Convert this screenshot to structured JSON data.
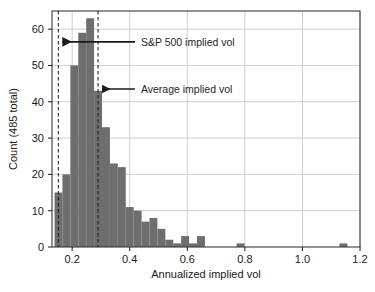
{
  "chart_data": {
    "type": "bar",
    "title": "",
    "subtitle": "",
    "xlabel": "Annualized implied vol",
    "ylabel": "Count (485 total)",
    "xlim": [
      0.13,
      1.2
    ],
    "ylim": [
      0,
      65
    ],
    "grid": true,
    "legend_position": "none",
    "bar_color": "#6e6e6e",
    "bin_width": 0.0275,
    "xticks": [
      "0.2",
      "0.4",
      "0.6",
      "0.8",
      "1.0",
      "1.2"
    ],
    "xtick_values": [
      0.2,
      0.4,
      0.6,
      0.8,
      1.0,
      1.2
    ],
    "yticks": [
      "0",
      "10",
      "20",
      "30",
      "40",
      "50",
      "60"
    ],
    "ytick_values": [
      0,
      10,
      20,
      30,
      40,
      50,
      60
    ],
    "x": [
      0.1525,
      0.18,
      0.2075,
      0.235,
      0.2625,
      0.29,
      0.3175,
      0.345,
      0.3725,
      0.4,
      0.4275,
      0.455,
      0.4825,
      0.51,
      0.5375,
      0.565,
      0.5925,
      0.62,
      0.6475,
      0.675,
      0.7025,
      0.73,
      0.7575,
      0.785,
      0.8125,
      0.84,
      0.8675,
      0.895,
      0.9225,
      0.95,
      0.9775,
      1.005,
      1.0325,
      1.06,
      1.0875,
      1.115,
      1.1425
    ],
    "values": [
      15,
      20,
      50,
      59,
      63,
      43,
      33,
      23,
      22,
      11,
      10,
      7,
      8,
      5,
      2,
      1,
      3,
      1,
      3,
      0,
      0,
      0,
      0,
      1,
      0,
      0,
      0,
      0,
      0,
      0,
      0,
      0,
      0,
      0,
      0,
      0,
      1
    ],
    "annotations": [
      {
        "label": "S&P 500 implied vol",
        "value": 0.152,
        "marker": "dashed-vertical-line",
        "arrow": "leftward",
        "label_x": 0.432,
        "label_y": 56.5
      },
      {
        "label": "Average implied vol",
        "value": 0.29,
        "marker": "dashed-vertical-line",
        "arrow": "leftward",
        "label_x": 0.432,
        "label_y": 43.5
      }
    ],
    "reference_lines": [
      {
        "name": "sp500-implied-vol-line",
        "value": 0.152,
        "style": "dashed",
        "color": "#1a1a1a"
      },
      {
        "name": "average-implied-vol-line",
        "value": 0.29,
        "style": "dashed",
        "color": "#1a1a1a"
      }
    ]
  }
}
